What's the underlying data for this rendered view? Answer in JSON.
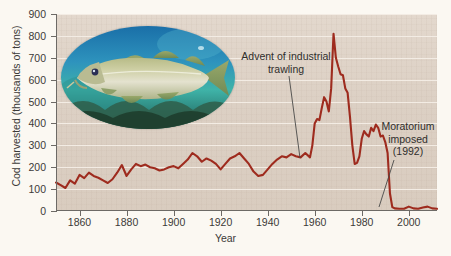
{
  "chart_data": {
    "type": "line",
    "title": "",
    "xlabel": "Year",
    "ylabel": "Cod harvested (thousands of tons)",
    "xlim": [
      1850,
      2012
    ],
    "ylim": [
      0,
      900
    ],
    "ytick_step": 100,
    "grid": "horizontal white gridlines",
    "legend": "none",
    "line_color": "#9e2b1e",
    "background_color": "#dcd0c4",
    "gridline_color": "#f3ece4",
    "axis_color": "#6d6a66",
    "yticks": [
      0,
      100,
      200,
      300,
      400,
      500,
      600,
      700,
      800,
      900
    ],
    "xticks": [
      1860,
      1880,
      1900,
      1920,
      1940,
      1960,
      1980,
      2000
    ],
    "series": [
      {
        "name": "Cod harvested",
        "x": [
          1850,
          1852,
          1854,
          1856,
          1858,
          1860,
          1862,
          1864,
          1866,
          1868,
          1870,
          1872,
          1874,
          1876,
          1878,
          1880,
          1882,
          1884,
          1886,
          1888,
          1890,
          1892,
          1894,
          1896,
          1898,
          1900,
          1902,
          1904,
          1906,
          1908,
          1910,
          1912,
          1914,
          1916,
          1918,
          1920,
          1922,
          1924,
          1926,
          1928,
          1930,
          1932,
          1934,
          1936,
          1938,
          1940,
          1942,
          1944,
          1946,
          1948,
          1950,
          1952,
          1954,
          1956,
          1958,
          1959,
          1960,
          1961,
          1962,
          1963,
          1964,
          1965,
          1966,
          1967,
          1968,
          1969,
          1970,
          1971,
          1972,
          1973,
          1974,
          1975,
          1976,
          1977,
          1978,
          1979,
          1980,
          1981,
          1982,
          1983,
          1984,
          1985,
          1986,
          1987,
          1988,
          1989,
          1990,
          1991,
          1992,
          1993,
          1994,
          1996,
          1998,
          2000,
          2002,
          2004,
          2006,
          2008,
          2010,
          2012
        ],
        "values": [
          130,
          118,
          105,
          140,
          125,
          165,
          150,
          175,
          160,
          152,
          140,
          128,
          145,
          175,
          210,
          160,
          190,
          215,
          205,
          212,
          200,
          195,
          185,
          190,
          200,
          205,
          195,
          215,
          235,
          265,
          250,
          225,
          240,
          230,
          215,
          190,
          215,
          240,
          250,
          265,
          240,
          215,
          180,
          160,
          165,
          190,
          215,
          235,
          250,
          245,
          260,
          250,
          245,
          265,
          245,
          300,
          400,
          420,
          415,
          470,
          520,
          500,
          455,
          560,
          810,
          700,
          660,
          625,
          620,
          560,
          540,
          430,
          300,
          215,
          220,
          250,
          330,
          365,
          350,
          340,
          380,
          365,
          395,
          380,
          340,
          345,
          315,
          265,
          80,
          18,
          12,
          10,
          10,
          20,
          12,
          10,
          16,
          20,
          12,
          10
        ]
      }
    ],
    "annotations": [
      {
        "id": "trawling",
        "text_line1": "Advent of industrial",
        "text_line2": "trawling",
        "points_to_year": 1958
      },
      {
        "id": "moratorium",
        "text_line1": "Moratorium",
        "text_line2": "imposed",
        "text_line3": "(1992)",
        "points_to_year": 1993
      }
    ],
    "inset_image": {
      "name": "atlantic-cod-photo",
      "shape": "oval",
      "description": "Atlantic cod swimming underwater"
    }
  },
  "axis": {
    "y_title": "Cod harvested (thousands of tons)",
    "x_title": "Year",
    "ylabels": [
      "900",
      "800",
      "700",
      "600",
      "500",
      "400",
      "300",
      "200",
      "100",
      "0"
    ],
    "xlabels": [
      "1860",
      "1880",
      "1900",
      "1920",
      "1940",
      "1960",
      "1980",
      "2000"
    ]
  },
  "annotations": {
    "trawling": {
      "line1": "Advent of industrial",
      "line2": "trawling"
    },
    "moratorium": {
      "line1": "Moratorium",
      "line2": "imposed",
      "line3": "(1992)"
    }
  }
}
